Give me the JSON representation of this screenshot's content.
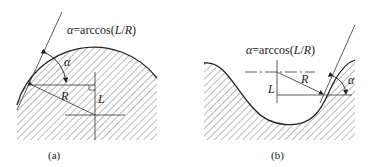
{
  "figure": {
    "panels": [
      {
        "id": "a",
        "caption": "(a)",
        "formula": {
          "alpha": "α",
          "rest": "=arccos(",
          "L": "L",
          "slash": "/",
          "R": "R",
          "close": ")"
        },
        "labels": {
          "alpha": "α",
          "R": "R",
          "L": "L"
        },
        "description": "convex circular arc with tangent line; angle alpha between tangent and horizontal-to-center line"
      },
      {
        "id": "b",
        "caption": "(b)",
        "formula": {
          "alpha": "α",
          "rest": "=arccos(",
          "L": "L",
          "slash": "/",
          "R": "R",
          "close": ")"
        },
        "labels": {
          "alpha": "α",
          "R": "R",
          "L": "L"
        },
        "description": "concave circular valley with tangent line; angle alpha between tangent and horizontal line"
      }
    ],
    "colors": {
      "line": "#333333",
      "hatch": "#555555",
      "background": "#ffffff"
    }
  }
}
